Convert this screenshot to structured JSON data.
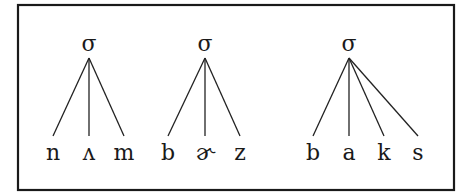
{
  "frame": {
    "x": 18,
    "y": 5,
    "width": 436,
    "height": 185,
    "stroke": "#1a1a1a"
  },
  "colors": {
    "line": "#222222",
    "text": "#1a1a1a",
    "background": "#ffffff"
  },
  "trees": [
    {
      "root": {
        "label": "σ",
        "x": 89,
        "y": 45,
        "apex_y": 58
      },
      "leaves": [
        {
          "label": "n",
          "x": 53
        },
        {
          "label": "ʌ",
          "x": 89
        },
        {
          "label": "m",
          "x": 124
        }
      ]
    },
    {
      "root": {
        "label": "σ",
        "x": 205,
        "y": 45,
        "apex_y": 58
      },
      "leaves": [
        {
          "label": "b",
          "x": 168
        },
        {
          "label": "ɚ",
          "x": 205
        },
        {
          "label": "z",
          "x": 240
        }
      ]
    },
    {
      "root": {
        "label": "σ",
        "x": 349,
        "y": 45,
        "apex_y": 58
      },
      "leaves": [
        {
          "label": "b",
          "x": 313
        },
        {
          "label": "a",
          "x": 349
        },
        {
          "label": "k",
          "x": 384
        },
        {
          "label": "s",
          "x": 418
        }
      ]
    }
  ],
  "layout": {
    "line_end_y": 136,
    "leaf_baseline_y": 160
  }
}
